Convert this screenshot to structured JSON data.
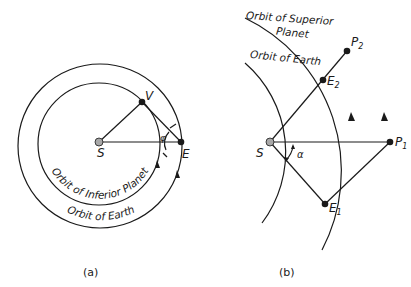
{
  "panel_a": {
    "caption": "(a)",
    "points": {
      "sun": "S",
      "inferior_planet": "V",
      "earth": "E"
    },
    "angle_label": "φ",
    "orbit_inner_label": "Orbit of Inferior Planet",
    "orbit_outer_label": "Orbit of Earth"
  },
  "panel_b": {
    "caption": "(b)",
    "points": {
      "sun": "S",
      "p1": "P",
      "p1_sub": "1",
      "p2": "P",
      "p2_sub": "2",
      "e1": "E",
      "e1_sub": "1",
      "e2": "E",
      "e2_sub": "2"
    },
    "angle_label": "α",
    "orbit_outer_label_line1": "Orbit of Superior",
    "orbit_outer_label_line2": "Planet",
    "orbit_inner_label": "Orbit of Earth"
  },
  "colors": {
    "ink": "#1a1a1a",
    "sun_fill": "#a8a8a8",
    "background": "#ffffff"
  }
}
